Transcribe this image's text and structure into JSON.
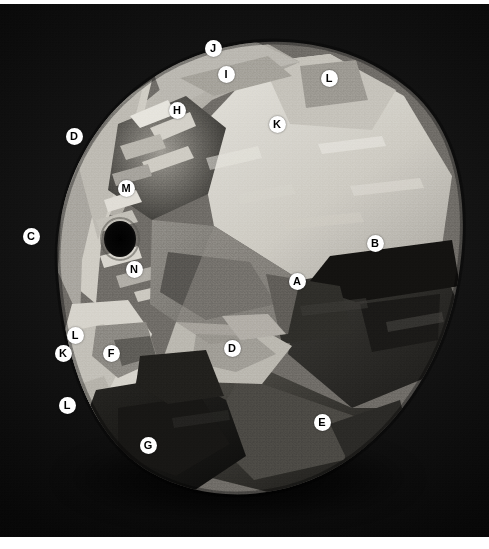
{
  "figure": {
    "medium": "grayscale photographic plate",
    "background_color": "#060606",
    "border_color": "#ffffff",
    "plate": {
      "x": 0,
      "y": 4,
      "width": 489,
      "height": 533
    }
  },
  "marker_style": {
    "shape": "filled-circle",
    "fill_color": "#ffffff",
    "text_color": "#000000",
    "diameter_px": 17
  },
  "markers": [
    {
      "id": "m-j",
      "label": "J",
      "x": 213,
      "y": 48,
      "region": "upper-rim-highlight"
    },
    {
      "id": "m-i",
      "label": "I",
      "x": 226,
      "y": 74,
      "region": "upper-crease-panel"
    },
    {
      "id": "m-l1",
      "label": "L",
      "x": 329,
      "y": 78,
      "region": "upper-right-bright-facet"
    },
    {
      "id": "m-h",
      "label": "H",
      "x": 177,
      "y": 110,
      "region": "central-crease-cluster"
    },
    {
      "id": "m-k1",
      "label": "K",
      "x": 277,
      "y": 124,
      "region": "large-bright-panel"
    },
    {
      "id": "m-d1",
      "label": "D",
      "x": 74,
      "y": 136,
      "region": "left-rim-fold"
    },
    {
      "id": "m-m",
      "label": "M",
      "x": 126,
      "y": 188,
      "region": "core-ridge"
    },
    {
      "id": "m-c",
      "label": "C",
      "x": 31,
      "y": 236,
      "region": "left-edge-sliver"
    },
    {
      "id": "m-b",
      "label": "B",
      "x": 375,
      "y": 243,
      "region": "right-shadow-facet"
    },
    {
      "id": "m-a",
      "label": "A",
      "x": 297,
      "y": 281,
      "region": "mid-shadow-facet"
    },
    {
      "id": "m-n",
      "label": "N",
      "x": 134,
      "y": 269,
      "region": "aperture-lip"
    },
    {
      "id": "m-l2",
      "label": "L",
      "x": 75,
      "y": 335,
      "region": "lower-left-bright-fold"
    },
    {
      "id": "m-k2",
      "label": "K",
      "x": 63,
      "y": 353,
      "region": "lower-left-panel"
    },
    {
      "id": "m-f",
      "label": "F",
      "x": 111,
      "y": 353,
      "region": "lower-mid-crease"
    },
    {
      "id": "m-d2",
      "label": "D",
      "x": 232,
      "y": 348,
      "region": "lower-right-fold"
    },
    {
      "id": "m-l3",
      "label": "L",
      "x": 67,
      "y": 405,
      "region": "lower-left-edge"
    },
    {
      "id": "m-e",
      "label": "E",
      "x": 322,
      "y": 422,
      "region": "lower-right-shadow-panel"
    },
    {
      "id": "m-g",
      "label": "G",
      "x": 148,
      "y": 445,
      "region": "bottom-dark-facet"
    }
  ],
  "aperture": {
    "name": "dark-opening",
    "cx": 120,
    "cy": 235,
    "rx": 15,
    "ry": 17,
    "color": "#050505"
  },
  "legend_letters": [
    "A",
    "B",
    "C",
    "D",
    "E",
    "F",
    "G",
    "H",
    "I",
    "J",
    "K",
    "L",
    "M",
    "N"
  ]
}
